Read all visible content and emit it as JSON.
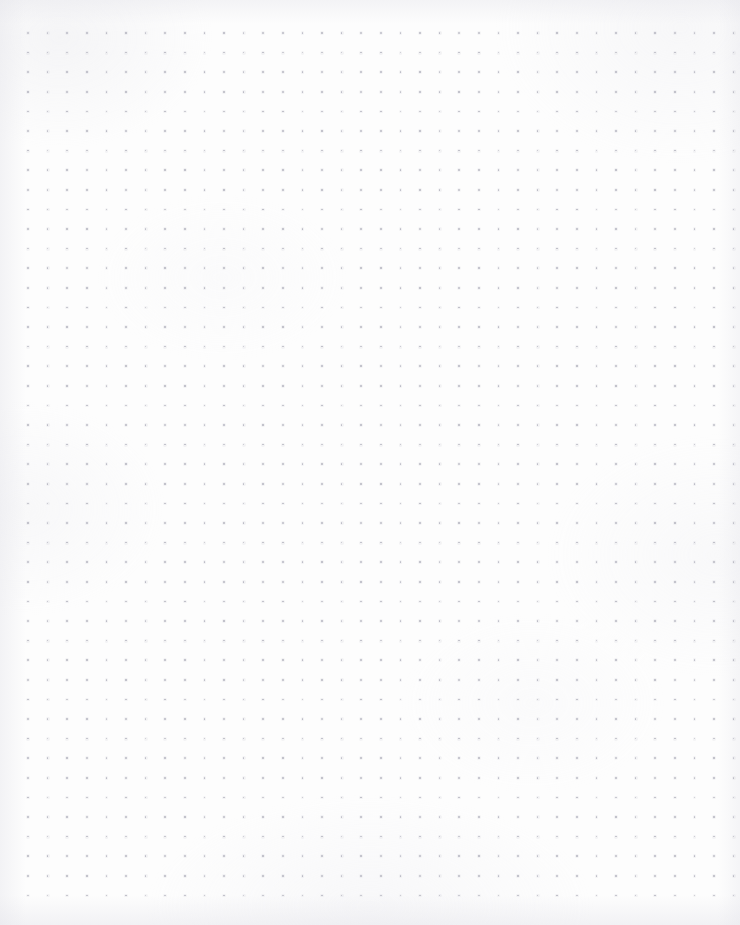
{
  "page": {
    "title": "Dot Grid Notebook Page",
    "width": 740,
    "height": 925,
    "background_color": "#fdfdfd",
    "paper_tone": "#fbfbfc",
    "content_text": "",
    "annotations": []
  },
  "grid": {
    "name": "dot-grid",
    "pattern": "dot-grid",
    "dot_color": "#b5b5c0",
    "dot_halo_color": "#c9c9d2",
    "dot_diameter_px": 1.6,
    "spacing_x_px": 19.6,
    "spacing_y_px": 19.6,
    "origin_x_px": 28,
    "origin_y_px": 33,
    "columns": 37,
    "rows": 45,
    "margin_left_px": 28,
    "margin_top_px": 33,
    "margin_right_px": 6,
    "margin_bottom_px": 28
  },
  "texture": {
    "name": "paper-texture",
    "vignette_color": "#e4e4ea",
    "mottle_color": "#ececf0",
    "opacity": 0.55
  }
}
